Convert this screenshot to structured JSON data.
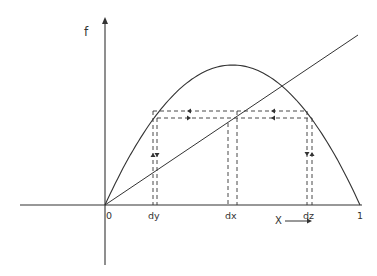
{
  "diagram": {
    "y_axis_label": "f",
    "x_axis_label": "X",
    "origin_label": "0",
    "x_end_label": "1",
    "tick_labels": {
      "dy": "dy",
      "dx": "dx",
      "dz": "dz"
    },
    "curves": [
      {
        "name": "parabola",
        "description": "f(x) = 4·λ·x(1−x), peak at x = 0.5"
      },
      {
        "name": "diagonal",
        "description": "f = x identity line"
      }
    ],
    "stroke_color": "#333333",
    "background_color": "#ffffff"
  }
}
